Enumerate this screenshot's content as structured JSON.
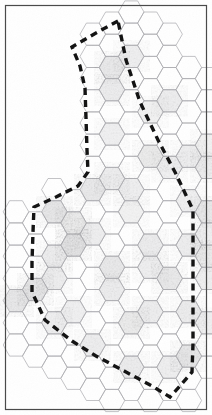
{
  "document": {
    "title": "Hexagonal Grid Region Map",
    "kind": "scanned-hex-map",
    "width": 212,
    "height": 415
  },
  "frame": {
    "name": "page-border",
    "x": 5.5,
    "y": 5.5,
    "width": 201,
    "height": 404,
    "stroke": "#4a4a4a",
    "stroke_width": 1.2,
    "fill": "none"
  },
  "canvas": {
    "background": "#ffffff",
    "paper_tint": "#fbfbfb"
  },
  "grid": {
    "name": "hex-grid",
    "orientation": "flat-top",
    "hex_width": 25.6,
    "hex_height": 22.2,
    "col_pitch": 19.2,
    "row_pitch": 22.2,
    "origin_x": 16,
    "origin_y": 12,
    "stroke": "#a9a9ad",
    "stroke_width": 0.7,
    "fill": "#ffffff",
    "columns": [
      {
        "col": 0,
        "rows": [
          9,
          10,
          11,
          12,
          13,
          14,
          15
        ]
      },
      {
        "col": 1,
        "rows": [
          9,
          10,
          11,
          12,
          13,
          14,
          15
        ]
      },
      {
        "col": 2,
        "rows": [
          8,
          9,
          10,
          11,
          12,
          13,
          14,
          15,
          16
        ]
      },
      {
        "col": 3,
        "rows": [
          8,
          9,
          10,
          11,
          12,
          13,
          14,
          15,
          16
        ]
      },
      {
        "col": 4,
        "rows": [
          1,
          2,
          3,
          4,
          5,
          6,
          7,
          8,
          9,
          10,
          11,
          12,
          13,
          14,
          15,
          16,
          17
        ]
      },
      {
        "col": 5,
        "rows": [
          0,
          1,
          2,
          3,
          4,
          5,
          6,
          7,
          8,
          9,
          10,
          11,
          12,
          13,
          14,
          15,
          16,
          17
        ]
      },
      {
        "col": 6,
        "rows": [
          0,
          1,
          2,
          3,
          4,
          5,
          6,
          7,
          8,
          9,
          10,
          11,
          12,
          13,
          14,
          15,
          16,
          17
        ]
      },
      {
        "col": 7,
        "rows": [
          0,
          1,
          2,
          3,
          4,
          5,
          6,
          7,
          8,
          9,
          10,
          11,
          12,
          13,
          14,
          15,
          16,
          17
        ]
      },
      {
        "col": 8,
        "rows": [
          1,
          2,
          3,
          4,
          5,
          6,
          7,
          8,
          9,
          10,
          11,
          12,
          13,
          14,
          15,
          16,
          17
        ]
      },
      {
        "col": 9,
        "rows": [
          2,
          3,
          4,
          5,
          6,
          7,
          8,
          9,
          10,
          11,
          12,
          13,
          14,
          15,
          16,
          17
        ]
      },
      {
        "col": 10,
        "rows": [
          3,
          4,
          5,
          6,
          7,
          8,
          9,
          10,
          11,
          12,
          13,
          14,
          15,
          16
        ]
      }
    ],
    "shaded_cells": [
      {
        "col": 5,
        "row": 2,
        "tone": 0.3
      },
      {
        "col": 6,
        "row": 2,
        "tone": 0.22
      },
      {
        "col": 5,
        "row": 3,
        "tone": 0.26
      },
      {
        "col": 7,
        "row": 4,
        "tone": 0.18
      },
      {
        "col": 8,
        "row": 4,
        "tone": 0.24
      },
      {
        "col": 5,
        "row": 5,
        "tone": 0.2
      },
      {
        "col": 7,
        "row": 6,
        "tone": 0.28
      },
      {
        "col": 9,
        "row": 6,
        "tone": 0.22
      },
      {
        "col": 10,
        "row": 6,
        "tone": 0.18
      },
      {
        "col": 5,
        "row": 7,
        "tone": 0.24
      },
      {
        "col": 8,
        "row": 7,
        "tone": 0.2
      },
      {
        "col": 10,
        "row": 7,
        "tone": 0.26
      },
      {
        "col": 4,
        "row": 8,
        "tone": 0.3
      },
      {
        "col": 6,
        "row": 8,
        "tone": 0.22
      },
      {
        "col": 9,
        "row": 8,
        "tone": 0.2
      },
      {
        "col": 2,
        "row": 9,
        "tone": 0.34
      },
      {
        "col": 3,
        "row": 9,
        "tone": 0.28
      },
      {
        "col": 6,
        "row": 9,
        "tone": 0.18
      },
      {
        "col": 10,
        "row": 9,
        "tone": 0.3
      },
      {
        "col": 3,
        "row": 10,
        "tone": 0.4
      },
      {
        "col": 4,
        "row": 10,
        "tone": 0.22
      },
      {
        "col": 7,
        "row": 10,
        "tone": 0.26
      },
      {
        "col": 9,
        "row": 10,
        "tone": 0.24
      },
      {
        "col": 10,
        "row": 10,
        "tone": 0.2
      },
      {
        "col": 2,
        "row": 11,
        "tone": 0.26
      },
      {
        "col": 5,
        "row": 11,
        "tone": 0.3
      },
      {
        "col": 7,
        "row": 11,
        "tone": 0.22
      },
      {
        "col": 10,
        "row": 11,
        "tone": 0.28
      },
      {
        "col": 1,
        "row": 12,
        "tone": 0.36
      },
      {
        "col": 2,
        "row": 12,
        "tone": 0.24
      },
      {
        "col": 5,
        "row": 12,
        "tone": 0.26
      },
      {
        "col": 8,
        "row": 12,
        "tone": 0.3
      },
      {
        "col": 10,
        "row": 12,
        "tone": 0.22
      },
      {
        "col": 0,
        "row": 13,
        "tone": 0.32
      },
      {
        "col": 3,
        "row": 13,
        "tone": 0.2
      },
      {
        "col": 7,
        "row": 13,
        "tone": 0.24
      },
      {
        "col": 9,
        "row": 13,
        "tone": 0.26
      },
      {
        "col": 2,
        "row": 14,
        "tone": 0.22
      },
      {
        "col": 6,
        "row": 14,
        "tone": 0.28
      },
      {
        "col": 10,
        "row": 14,
        "tone": 0.2
      },
      {
        "col": 4,
        "row": 15,
        "tone": 0.24
      },
      {
        "col": 9,
        "row": 15,
        "tone": 0.34
      },
      {
        "col": 6,
        "row": 16,
        "tone": 0.26
      },
      {
        "col": 8,
        "row": 16,
        "tone": 0.22
      }
    ]
  },
  "boundary": {
    "name": "region-boundary",
    "label": "dashed region outline",
    "stroke": "#141414",
    "stroke_width": 3.4,
    "dash_array": "7 5",
    "closed": true,
    "vertices": [
      [
        118,
        21
      ],
      [
        96,
        33
      ],
      [
        72,
        47
      ],
      [
        80,
        66
      ],
      [
        85,
        88
      ],
      [
        86,
        118
      ],
      [
        87,
        150
      ],
      [
        88,
        172
      ],
      [
        78,
        186
      ],
      [
        56,
        197
      ],
      [
        34,
        207
      ],
      [
        33,
        232
      ],
      [
        32,
        262
      ],
      [
        32,
        292
      ],
      [
        45,
        320
      ],
      [
        72,
        341
      ],
      [
        96,
        356
      ],
      [
        126,
        372
      ],
      [
        152,
        386
      ],
      [
        170,
        397
      ],
      [
        180,
        386
      ],
      [
        192,
        372
      ],
      [
        193,
        344
      ],
      [
        193,
        312
      ],
      [
        193,
        278
      ],
      [
        193,
        244
      ],
      [
        193,
        210
      ],
      [
        176,
        174
      ],
      [
        158,
        140
      ],
      [
        140,
        102
      ],
      [
        126,
        60
      ]
    ]
  },
  "legend": {
    "visible": false,
    "items": []
  }
}
